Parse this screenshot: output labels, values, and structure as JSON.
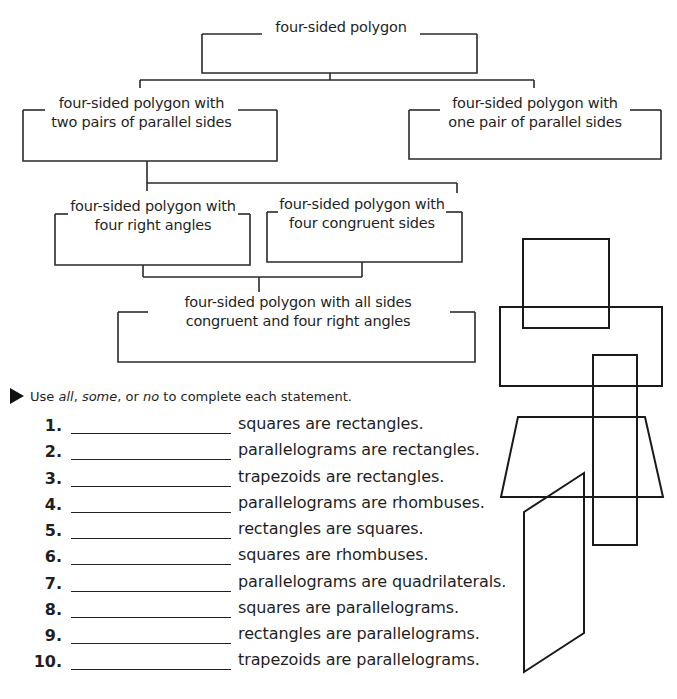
{
  "flowchart": {
    "nodes": [
      {
        "id": "root",
        "lines": [
          "four-sided polygon"
        ]
      },
      {
        "id": "two-pairs",
        "lines": [
          "four-sided polygon with",
          "two pairs of parallel sides"
        ]
      },
      {
        "id": "one-pair",
        "lines": [
          "four-sided polygon with",
          "one pair of parallel sides"
        ]
      },
      {
        "id": "right-angles",
        "lines": [
          "four-sided polygon with",
          "four right angles"
        ]
      },
      {
        "id": "congruent-sides",
        "lines": [
          "four-sided polygon with",
          "four congruent sides"
        ]
      },
      {
        "id": "all",
        "lines": [
          "four-sided polygon with all sides",
          "congruent and four right angles"
        ]
      }
    ]
  },
  "instructions": {
    "prefix": "Use ",
    "w1": "all",
    "sep1": ", ",
    "w2": "some",
    "sep2": ", or ",
    "w3": "no",
    "suffix": " to complete each statement."
  },
  "questions": [
    {
      "num": "1.",
      "text": "squares are rectangles."
    },
    {
      "num": "2.",
      "text": "parallelograms are rectangles."
    },
    {
      "num": "3.",
      "text": "trapezoids are rectangles."
    },
    {
      "num": "4.",
      "text": "parallelograms are rhombuses."
    },
    {
      "num": "5.",
      "text": "rectangles are squares."
    },
    {
      "num": "6.",
      "text": "squares are rhombuses."
    },
    {
      "num": "7.",
      "text": "parallelograms are quadrilaterals."
    },
    {
      "num": "8.",
      "text": "squares are parallelograms."
    },
    {
      "num": "9.",
      "text": "rectangles are parallelograms."
    },
    {
      "num": "10.",
      "text": "trapezoids are parallelograms."
    }
  ],
  "colors": {
    "line": "#222222",
    "text": "#1f1f1f",
    "background": "#ffffff"
  }
}
